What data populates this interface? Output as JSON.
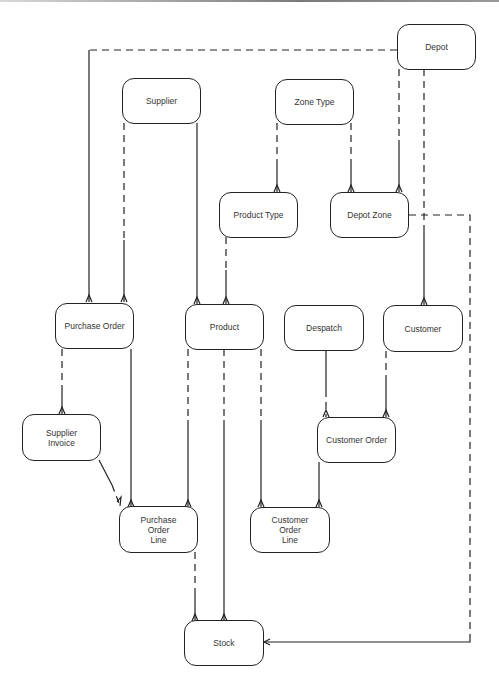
{
  "diagram": {
    "type": "entity-relationship",
    "entities": [
      {
        "id": "depot",
        "label": "Depot"
      },
      {
        "id": "supplier",
        "label": "Supplier"
      },
      {
        "id": "zone_type",
        "label": "Zone Type"
      },
      {
        "id": "product_type",
        "label": "Product Type"
      },
      {
        "id": "depot_zone",
        "label": "Depot Zone"
      },
      {
        "id": "purchase_order",
        "label": "Purchase Order"
      },
      {
        "id": "product",
        "label": "Product"
      },
      {
        "id": "despatch",
        "label": "Despatch"
      },
      {
        "id": "customer",
        "label": "Customer"
      },
      {
        "id": "supplier_invoice",
        "label": "Supplier Invoice"
      },
      {
        "id": "customer_order",
        "label": "Customer Order"
      },
      {
        "id": "purchase_order_line",
        "label": "Purchase Order Line"
      },
      {
        "id": "customer_order_line",
        "label": "Customer Order Line"
      },
      {
        "id": "stock",
        "label": "Stock"
      }
    ],
    "relationships": [
      {
        "from": "Depot",
        "to": "Purchase Order",
        "style": "dashed-solid",
        "cardinality": "one-to-many"
      },
      {
        "from": "Depot",
        "to": "Depot Zone",
        "style": "dashed-solid",
        "cardinality": "one-to-many"
      },
      {
        "from": "Depot",
        "to": "Customer",
        "style": "dashed-solid",
        "cardinality": "one-to-many"
      },
      {
        "from": "Supplier",
        "to": "Purchase Order",
        "style": "dashed",
        "cardinality": "one-to-many"
      },
      {
        "from": "Supplier",
        "to": "Product",
        "style": "solid",
        "cardinality": "one-to-many"
      },
      {
        "from": "Zone Type",
        "to": "Product Type",
        "style": "dashed-solid",
        "cardinality": "one-to-many"
      },
      {
        "from": "Zone Type",
        "to": "Depot Zone",
        "style": "dashed-solid",
        "cardinality": "one-to-many"
      },
      {
        "from": "Product Type",
        "to": "Product",
        "style": "dashed-solid",
        "cardinality": "one-to-many"
      },
      {
        "from": "Depot Zone",
        "to": "Stock",
        "style": "dashed-solid",
        "cardinality": "one-to-many"
      },
      {
        "from": "Purchase Order",
        "to": "Supplier Invoice",
        "style": "dashed-solid",
        "cardinality": "one-to-many"
      },
      {
        "from": "Purchase Order",
        "to": "Purchase Order Line",
        "style": "solid",
        "cardinality": "one-to-many"
      },
      {
        "from": "Supplier Invoice",
        "to": "Purchase Order Line",
        "style": "solid-dashed",
        "cardinality": "one-to-many"
      },
      {
        "from": "Product",
        "to": "Purchase Order Line",
        "style": "dashed-solid",
        "cardinality": "one-to-many"
      },
      {
        "from": "Product",
        "to": "Stock",
        "style": "dashed-solid",
        "cardinality": "one-to-many"
      },
      {
        "from": "Product",
        "to": "Customer Order Line",
        "style": "dashed-solid",
        "cardinality": "one-to-many"
      },
      {
        "from": "Despatch",
        "to": "Customer Order",
        "style": "solid-dashed",
        "cardinality": "one-to-many"
      },
      {
        "from": "Customer",
        "to": "Customer Order",
        "style": "dashed-solid",
        "cardinality": "one-to-many"
      },
      {
        "from": "Customer Order",
        "to": "Customer Order Line",
        "style": "solid",
        "cardinality": "one-to-many"
      },
      {
        "from": "Purchase Order Line",
        "to": "Stock",
        "style": "dashed-solid",
        "cardinality": "one-to-many"
      }
    ]
  }
}
